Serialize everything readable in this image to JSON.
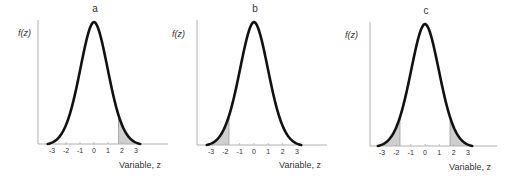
{
  "chart_data": [
    {
      "type": "line",
      "title": "a",
      "xlabel": "Variable, z",
      "ylabel": "f(z)",
      "x_ticks": [
        -3,
        -2,
        -1,
        0,
        1,
        2,
        3
      ],
      "x_tick_labels": [
        "-3",
        "-2",
        "-1",
        "0",
        "1",
        "2",
        "3"
      ],
      "xlim": [
        -3.3,
        3.3
      ],
      "curve": "standard normal density",
      "shaded_regions": [
        {
          "from": 1.75,
          "to": 3.3,
          "tail": "upper"
        }
      ],
      "grid": false,
      "legend": null
    },
    {
      "type": "line",
      "title": "b",
      "xlabel": "Variable, z",
      "ylabel": "f(z)",
      "x_ticks": [
        -3,
        -2,
        -1,
        0,
        1,
        2,
        3
      ],
      "x_tick_labels": [
        "-3",
        "-2",
        "-1",
        "0",
        "1",
        "2",
        "3"
      ],
      "xlim": [
        -3.3,
        3.3
      ],
      "curve": "standard normal density",
      "shaded_regions": [
        {
          "from": -3.3,
          "to": -1.75,
          "tail": "lower"
        }
      ],
      "grid": false,
      "legend": null
    },
    {
      "type": "line",
      "title": "c",
      "xlabel": "Variable, z",
      "ylabel": "f(z)",
      "x_ticks": [
        -3,
        -2,
        -1,
        0,
        1,
        2,
        3
      ],
      "x_tick_labels": [
        "-3",
        "-2",
        "-1",
        "0",
        "1",
        "2",
        "3"
      ],
      "xlim": [
        -3.3,
        3.3
      ],
      "curve": "standard normal density",
      "shaded_regions": [
        {
          "from": -3.3,
          "to": -1.75,
          "tail": "lower"
        },
        {
          "from": 1.75,
          "to": 3.3,
          "tail": "upper"
        }
      ],
      "grid": false,
      "legend": null
    }
  ],
  "colors": {
    "curve": "#111111",
    "axis": "#b0b0b0",
    "shade": "#cfcfcf",
    "shade_edge": "#9a9a9a",
    "text": "#333333"
  },
  "layout": {
    "panels": [
      {
        "axis_x": 38,
        "axis_top": 20,
        "baseline_y": 144,
        "baseline_end": 168,
        "zero_x": 94,
        "unit": 14,
        "peak_y": 22,
        "title_x": 95,
        "title_y": 12,
        "ylabel_x": 18,
        "ylabel_y": 36,
        "xlabel_x": 140,
        "xlabel_y": 168
      },
      {
        "axis_x": 197,
        "axis_top": 20,
        "baseline_y": 145,
        "baseline_end": 327,
        "zero_x": 254,
        "unit": 14.3,
        "peak_y": 22,
        "title_x": 255,
        "title_y": 12,
        "ylabel_x": 172,
        "ylabel_y": 37,
        "xlabel_x": 300,
        "xlabel_y": 168
      },
      {
        "axis_x": 370,
        "axis_top": 22,
        "baseline_y": 146,
        "baseline_end": 497,
        "zero_x": 425,
        "unit": 14.3,
        "peak_y": 24,
        "title_x": 426,
        "title_y": 14,
        "ylabel_x": 345,
        "ylabel_y": 38,
        "xlabel_x": 470,
        "xlabel_y": 170
      }
    ]
  }
}
